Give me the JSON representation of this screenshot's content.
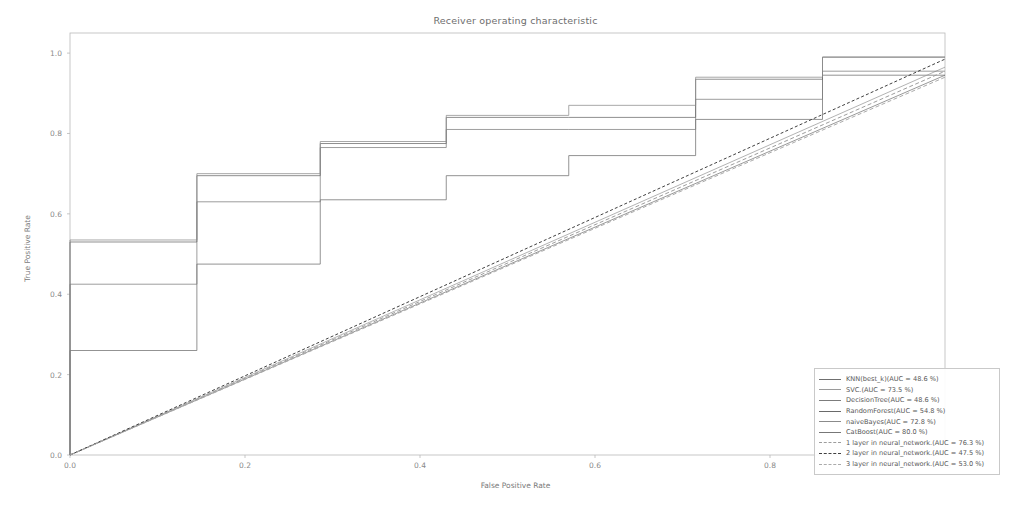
{
  "chart_data": {
    "type": "line",
    "title": "Receiver operating characteristic",
    "xlabel": "False Positive Rate",
    "ylabel": "True Positive Rate",
    "xlim": [
      0.0,
      1.0
    ],
    "ylim": [
      0.0,
      1.05
    ],
    "xticks": [
      "0.0",
      "0.2",
      "0.4",
      "0.6",
      "0.8",
      "1.0"
    ],
    "xtick_values": [
      0.0,
      0.2,
      0.4,
      0.6,
      0.8,
      1.0
    ],
    "yticks": [
      "0.0",
      "0.2",
      "0.4",
      "0.6",
      "0.8",
      "1.0"
    ],
    "ytick_values": [
      0.0,
      0.2,
      0.4,
      0.6,
      0.8,
      1.0
    ],
    "grid": false,
    "legend_position": "lower right",
    "series": [
      {
        "name": "KNN(best_k)",
        "auc": 48.6,
        "legend_label": "KNN(best_k)(AUC = 48.6 %)",
        "style": "solid",
        "color": "#6f6f6f",
        "kind": "step",
        "x": [
          0.0,
          0.0,
          0.145,
          0.145,
          0.286,
          0.286,
          0.43,
          0.43,
          0.57,
          0.57,
          0.715,
          0.715,
          0.86,
          0.86,
          1.0
        ],
        "y": [
          0.0,
          0.26,
          0.26,
          0.475,
          0.475,
          0.635,
          0.635,
          0.695,
          0.695,
          0.745,
          0.745,
          0.835,
          0.835,
          0.945,
          0.945
        ]
      },
      {
        "name": "SVC",
        "auc": 73.5,
        "legend_label": "SVC.(AUC = 73.5 %)",
        "style": "solid",
        "color": "#9a9a9a",
        "kind": "line",
        "x": [
          0.0,
          1.0
        ],
        "y": [
          0.0,
          0.965
        ]
      },
      {
        "name": "DecisionTree",
        "auc": 48.6,
        "legend_label": "DecisionTree(AUC = 48.6 %)",
        "style": "solid",
        "color": "#7c7c7c",
        "kind": "step",
        "x": [
          0.0,
          0.0,
          0.145,
          0.145,
          0.286,
          0.286,
          0.43,
          0.43,
          0.57,
          0.57,
          0.715,
          0.715,
          0.86,
          0.86,
          1.0
        ],
        "y": [
          0.0,
          0.425,
          0.425,
          0.63,
          0.63,
          0.765,
          0.765,
          0.81,
          0.81,
          0.81,
          0.81,
          0.885,
          0.885,
          0.955,
          0.955
        ]
      },
      {
        "name": "RandomForest",
        "auc": 54.8,
        "legend_label": "RandomForest(AUC = 54.8 %)",
        "style": "solid",
        "color": "#6a6a6a",
        "kind": "step",
        "x": [
          0.0,
          0.0,
          0.145,
          0.145,
          0.286,
          0.286,
          0.43,
          0.43,
          0.57,
          0.57,
          0.715,
          0.715,
          0.86,
          0.86,
          1.0
        ],
        "y": [
          0.0,
          0.53,
          0.53,
          0.695,
          0.695,
          0.775,
          0.775,
          0.84,
          0.84,
          0.84,
          0.84,
          0.935,
          0.935,
          0.99,
          0.99
        ]
      },
      {
        "name": "naiveBayes",
        "auc": 72.8,
        "legend_label": "naiveBayes(AUC = 72.8 %)",
        "style": "solid",
        "color": "#8b8b8b",
        "kind": "step",
        "x": [
          0.0,
          0.0,
          0.145,
          0.145,
          0.286,
          0.286,
          0.43,
          0.43,
          0.57,
          0.57,
          0.715,
          0.715,
          0.86,
          0.86,
          1.0
        ],
        "y": [
          0.0,
          0.535,
          0.535,
          0.7,
          0.7,
          0.78,
          0.78,
          0.845,
          0.845,
          0.87,
          0.87,
          0.94,
          0.94,
          0.99,
          0.99
        ]
      },
      {
        "name": "CatBoost",
        "auc": 80.0,
        "legend_label": "CatBoost(AUC = 80.0 %)",
        "style": "solid",
        "color": "#777777",
        "kind": "line",
        "x": [
          0.0,
          1.0
        ],
        "y": [
          0.0,
          0.945
        ]
      },
      {
        "name": "1 layer in neural_network",
        "auc": 76.3,
        "legend_label": "1 layer in neural_network.(AUC = 76.3 %)",
        "style": "dashed",
        "color": "#9d9d9d",
        "kind": "line",
        "x": [
          0.0,
          1.0
        ],
        "y": [
          0.0,
          0.955
        ]
      },
      {
        "name": "2 layer in neural_network",
        "auc": 47.5,
        "legend_label": "2 layer in neural_network.(AUC = 47.5 %)",
        "style": "dashed",
        "color": "#404040",
        "kind": "line",
        "x": [
          0.0,
          1.0
        ],
        "y": [
          0.0,
          0.985
        ]
      },
      {
        "name": "3 layer in neural_network",
        "auc": 53.0,
        "legend_label": "3 layer in neural_network.(AUC = 53.0 %)",
        "style": "dashed",
        "color": "#ababab",
        "kind": "line",
        "x": [
          0.0,
          1.0
        ],
        "y": [
          0.0,
          0.94
        ]
      }
    ]
  }
}
